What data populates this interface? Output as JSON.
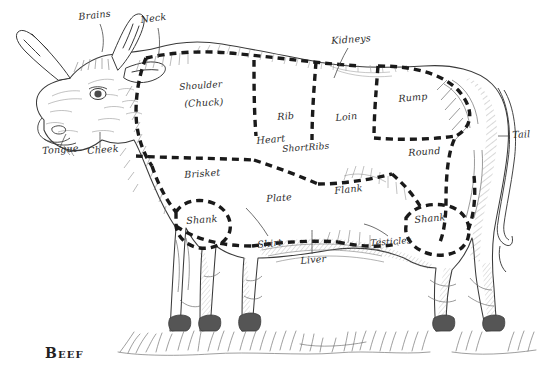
{
  "figure": {
    "caption": "Beef",
    "ink_color": "#2b2b2b",
    "paper_color": "#ffffff",
    "cut_line_style": "dashed"
  },
  "labels": [
    {
      "id": "brains",
      "text": "Brains",
      "x": 78,
      "y": 12,
      "rot": -6,
      "leader": true
    },
    {
      "id": "neck",
      "text": "Neck",
      "x": 140,
      "y": 15,
      "rot": -7,
      "leader": true
    },
    {
      "id": "kidneys",
      "text": "Kidneys",
      "x": 331,
      "y": 36,
      "rot": -4,
      "leader": true
    },
    {
      "id": "shoulder",
      "text": "Shoulder",
      "x": 179,
      "y": 83,
      "rot": -4,
      "leader": false
    },
    {
      "id": "chuck",
      "text": "(Chuck)",
      "x": 184,
      "y": 99,
      "rot": -3,
      "leader": false
    },
    {
      "id": "rib",
      "text": "Rib",
      "x": 277,
      "y": 112,
      "rot": -4,
      "leader": false
    },
    {
      "id": "loin",
      "text": "Loin",
      "x": 335,
      "y": 113,
      "rot": -5,
      "leader": false
    },
    {
      "id": "rump",
      "text": "Rump",
      "x": 398,
      "y": 94,
      "rot": -5,
      "leader": false
    },
    {
      "id": "tail",
      "text": "Tail",
      "x": 512,
      "y": 130,
      "rot": -3,
      "leader": true
    },
    {
      "id": "tongue",
      "text": "Tongue",
      "x": 42,
      "y": 146,
      "rot": -4,
      "leader": true
    },
    {
      "id": "cheek",
      "text": "Cheek",
      "x": 87,
      "y": 146,
      "rot": -4,
      "leader": true
    },
    {
      "id": "heart",
      "text": "Heart",
      "x": 256,
      "y": 136,
      "rot": -5,
      "leader": false
    },
    {
      "id": "short-ribs",
      "text": "ShortRibs",
      "x": 282,
      "y": 145,
      "rot": -4,
      "leader": false
    },
    {
      "id": "round",
      "text": "Round",
      "x": 408,
      "y": 148,
      "rot": -4,
      "leader": false
    },
    {
      "id": "brisket",
      "text": "Brisket",
      "x": 184,
      "y": 170,
      "rot": -4,
      "leader": false
    },
    {
      "id": "plate",
      "text": "Plate",
      "x": 266,
      "y": 194,
      "rot": -4,
      "leader": false
    },
    {
      "id": "flank",
      "text": "Flank",
      "x": 334,
      "y": 186,
      "rot": -6,
      "leader": false
    },
    {
      "id": "shank-fore",
      "text": "Shank",
      "x": 186,
      "y": 216,
      "rot": -4,
      "leader": false
    },
    {
      "id": "shank-hind",
      "text": "Shank",
      "x": 414,
      "y": 215,
      "rot": -5,
      "leader": false
    },
    {
      "id": "skirt",
      "text": "Skirt",
      "x": 257,
      "y": 240,
      "rot": -6,
      "leader": true
    },
    {
      "id": "testicles",
      "text": "Testicles",
      "x": 370,
      "y": 239,
      "rot": -4,
      "leader": true
    },
    {
      "id": "liver",
      "text": "Liver",
      "x": 300,
      "y": 256,
      "rot": -5,
      "leader": true
    }
  ],
  "cuts": [
    "Brains",
    "Neck",
    "Kidneys",
    "Shoulder (Chuck)",
    "Rib",
    "Loin",
    "Rump",
    "Tail",
    "Tongue",
    "Cheek",
    "Heart",
    "ShortRibs",
    "Round",
    "Brisket",
    "Plate",
    "Flank",
    "Shank",
    "Skirt",
    "Testicles",
    "Liver"
  ]
}
